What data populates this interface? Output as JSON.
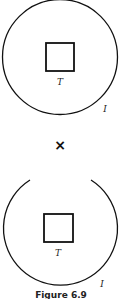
{
  "figure": {
    "caption": "Figure 6.9",
    "operator": "×",
    "top_diagram": {
      "outer_label": "I",
      "inner_label": "T",
      "outer_shape": "closed-circle",
      "inner_shape": "square"
    },
    "bottom_diagram": {
      "outer_label": "I",
      "inner_label": "T",
      "outer_shape": "open-circle-arc",
      "inner_shape": "square"
    }
  },
  "colors": {
    "stroke": "#111111",
    "background": "#ffffff"
  }
}
